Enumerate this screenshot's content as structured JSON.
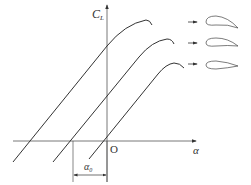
{
  "diagram": {
    "y_axis_label": "C",
    "y_axis_sub": "L",
    "x_axis_label": "α",
    "origin_label": "O",
    "zero_lift_label": "α",
    "zero_lift_sub": "0",
    "colors": {
      "line": "#333333",
      "background": "#ffffff"
    },
    "curves": [
      {
        "name": "high-camber",
        "airfoil": "highly cambered airfoil"
      },
      {
        "name": "medium-camber",
        "airfoil": "moderately cambered airfoil"
      },
      {
        "name": "symmetric",
        "airfoil": "symmetric airfoil"
      }
    ]
  }
}
